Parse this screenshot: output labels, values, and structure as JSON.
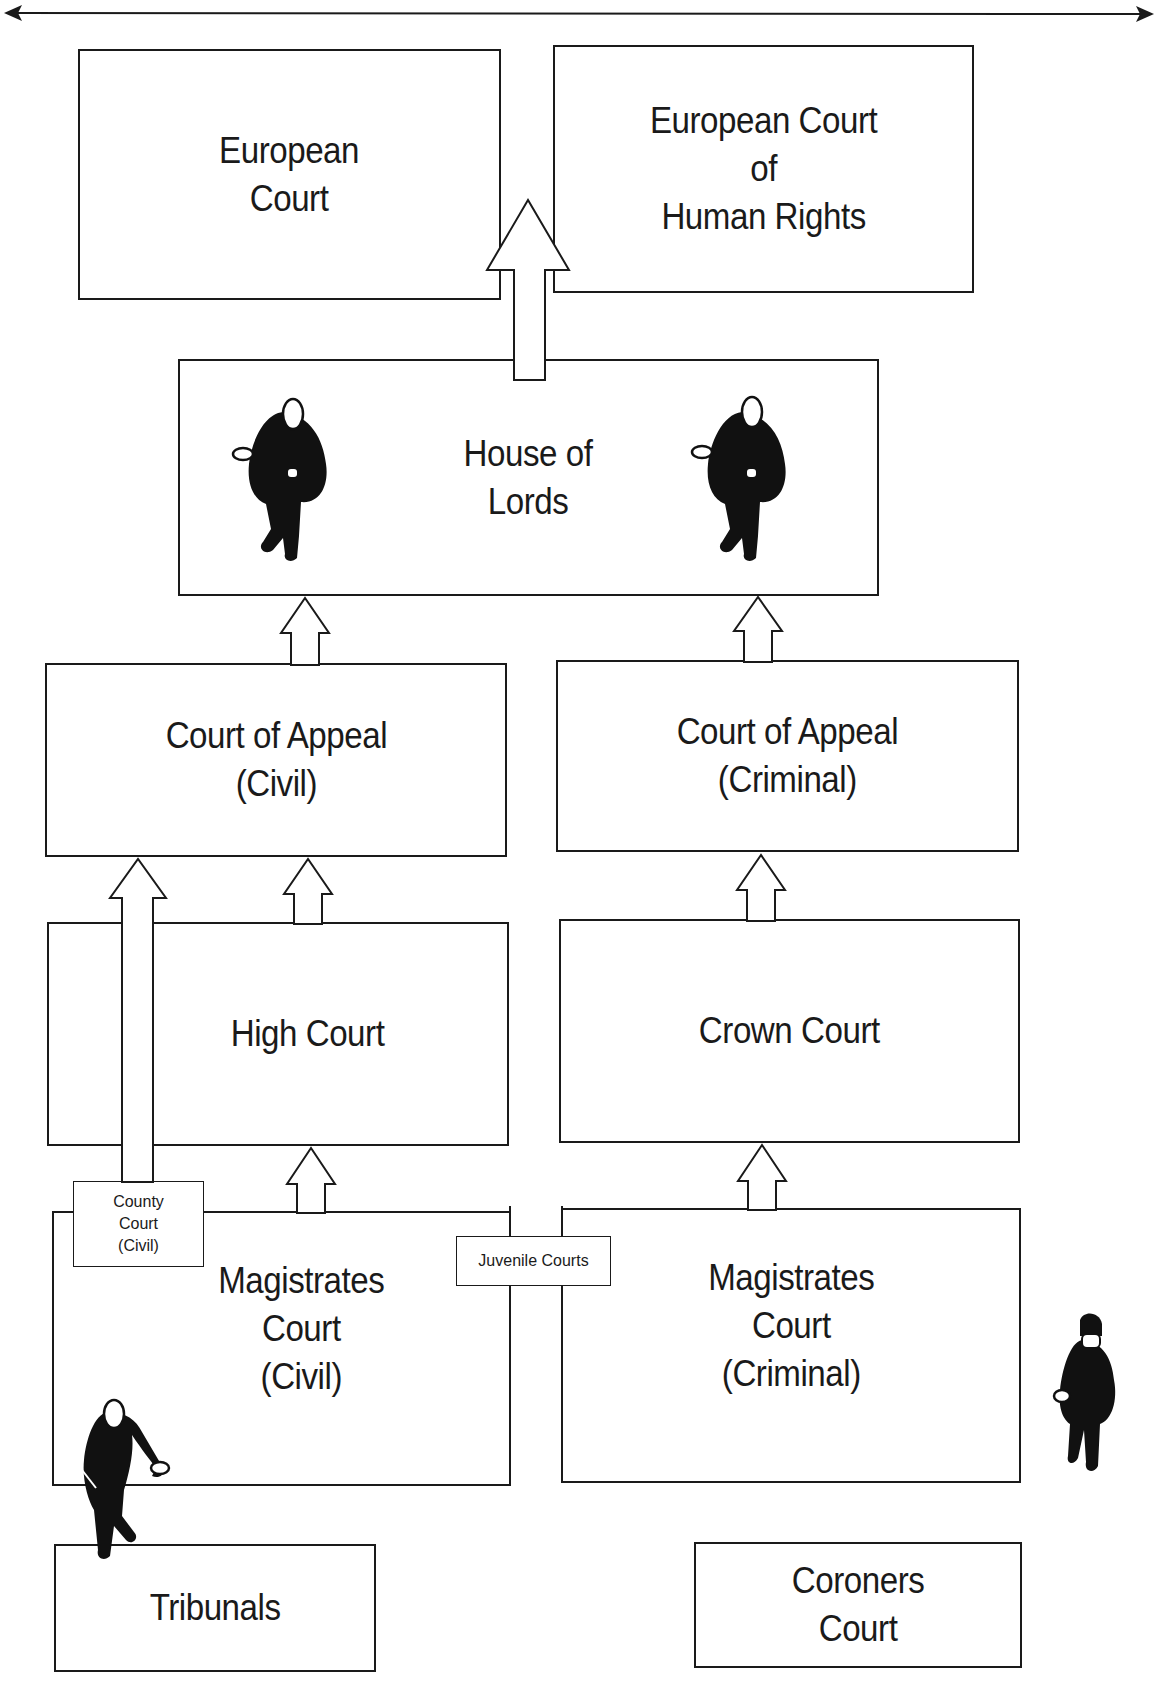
{
  "diagram": {
    "title_arrow": "double-headed horizontal arrow",
    "courts": {
      "european_court": "European\nCourt",
      "echr": "European Court\nof\nHuman Rights",
      "house_of_lords": "House of\nLords",
      "appeal_civil": "Court of Appeal\n(Civil)",
      "appeal_criminal": "Court of Appeal\n(Criminal)",
      "high_court": "High Court",
      "crown_court": "Crown Court",
      "county_court": "County\nCourt\n(Civil)",
      "juvenile_courts": "Juvenile Courts",
      "magistrates_civil": "Magistrates\nCourt\n(Civil)",
      "magistrates_criminal": "Magistrates\nCourt\n(Criminal)",
      "tribunals": "Tribunals",
      "coroners": "Coroners\nCourt"
    },
    "appeals": [
      {
        "from": "House of Lords",
        "to": "European Court / European Court of Human Rights"
      },
      {
        "from": "Court of Appeal (Civil)",
        "to": "House of Lords"
      },
      {
        "from": "Court of Appeal (Criminal)",
        "to": "House of Lords"
      },
      {
        "from": "High Court",
        "to": "Court of Appeal (Civil)"
      },
      {
        "from": "County Court (Civil)",
        "to": "Court of Appeal (Civil)"
      },
      {
        "from": "Crown Court",
        "to": "Court of Appeal (Criminal)"
      },
      {
        "from": "Magistrates Court (Civil)",
        "to": "High Court"
      },
      {
        "from": "Magistrates Court (Criminal)",
        "to": "Crown Court"
      }
    ],
    "figures": [
      "judge",
      "judge",
      "barrister",
      "police-officer"
    ]
  }
}
